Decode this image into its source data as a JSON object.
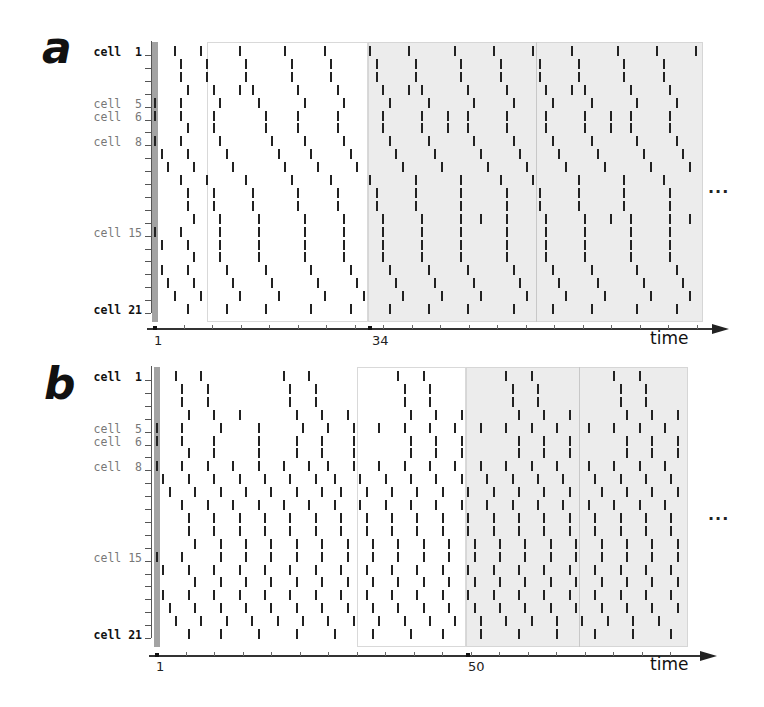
{
  "chart_data": [
    {
      "type": "raster",
      "panel": "a",
      "title": "",
      "xlabel": "time",
      "ylabel": "",
      "cells": 21,
      "ytick_labels": [
        {
          "cell": 1,
          "label": "cell  1",
          "style": "bold"
        },
        {
          "cell": 5,
          "label": "cell  5",
          "style": "light"
        },
        {
          "cell": 6,
          "label": "cell  6",
          "style": "light"
        },
        {
          "cell": 8,
          "label": "cell  8",
          "style": "light"
        },
        {
          "cell": 15,
          "label": "cell 15",
          "style": "light"
        },
        {
          "cell": 21,
          "label": "cell 21",
          "style": "bold"
        }
      ],
      "xtick_labels": [
        {
          "t": 1,
          "label": "1"
        },
        {
          "t": 34,
          "label": "34"
        }
      ],
      "initial_stimulus_cells": [
        5,
        6,
        8,
        15
      ],
      "transient_region": [
        9,
        34
      ],
      "periodic_region_start": 34,
      "period_divider_t": 59.5,
      "x_range": [
        1,
        85
      ],
      "continues": "...",
      "spikes": [
        [
          4,
          8,
          14,
          21,
          27,
          34,
          40,
          47,
          53,
          59,
          65,
          72,
          78,
          84
        ],
        [
          5,
          9,
          15,
          22,
          28,
          35,
          41,
          48,
          54,
          60,
          66,
          73,
          79
        ],
        [
          5,
          9,
          15,
          22,
          28,
          35,
          41,
          48,
          54,
          60,
          66,
          73,
          79
        ],
        [
          6,
          10,
          14,
          16,
          23,
          29,
          36,
          40,
          42,
          49,
          55,
          61,
          65,
          67,
          74,
          80
        ],
        [
          1,
          5,
          11,
          17,
          24,
          30,
          37,
          43,
          50,
          56,
          62,
          68,
          75,
          81
        ],
        [
          1,
          5,
          10,
          18,
          23,
          29,
          36,
          42,
          46,
          49,
          55,
          61,
          67,
          71,
          74,
          80
        ],
        [
          6,
          10,
          18,
          23,
          29,
          36,
          42,
          46,
          49,
          55,
          61,
          67,
          71,
          74,
          80
        ],
        [
          1,
          5,
          11,
          19,
          24,
          30,
          37,
          43,
          50,
          56,
          62,
          68,
          75,
          81
        ],
        [
          2,
          6,
          12,
          20,
          25,
          31,
          38,
          44,
          51,
          57,
          63,
          69,
          76,
          82
        ],
        [
          3,
          7,
          13,
          21,
          26,
          32,
          39,
          45,
          52,
          58,
          64,
          70,
          77,
          83
        ],
        [
          5,
          9,
          15,
          22,
          28,
          34,
          41,
          48,
          54,
          59,
          66,
          73,
          79
        ],
        [
          6,
          10,
          16,
          23,
          29,
          35,
          41,
          48,
          55,
          60,
          66,
          73,
          80
        ],
        [
          6,
          10,
          16,
          23,
          29,
          35,
          41,
          48,
          55,
          60,
          66,
          73,
          80
        ],
        [
          7,
          11,
          17,
          24,
          30,
          36,
          42,
          48,
          51,
          55,
          61,
          67,
          71,
          74,
          80,
          83
        ],
        [
          1,
          5,
          11,
          17,
          24,
          30,
          36,
          42,
          48,
          55,
          61,
          67,
          74,
          80
        ],
        [
          2,
          6,
          11,
          17,
          24,
          30,
          36,
          42,
          48,
          55,
          61,
          67,
          74,
          80
        ],
        [
          7,
          11,
          17,
          24,
          30,
          36,
          42,
          48,
          55,
          61,
          67,
          74,
          80
        ],
        [
          2,
          6,
          12,
          18,
          25,
          31,
          37,
          43,
          49,
          56,
          62,
          68,
          75,
          81
        ],
        [
          3,
          7,
          13,
          19,
          26,
          32,
          38,
          44,
          50,
          57,
          63,
          69,
          76,
          82
        ],
        [
          4,
          8,
          14,
          20,
          27,
          33,
          39,
          45,
          51,
          58,
          64,
          70,
          77,
          83
        ],
        [
          6,
          12,
          18,
          25,
          31,
          37,
          43,
          49,
          56,
          62,
          68,
          75,
          81
        ]
      ]
    },
    {
      "type": "raster",
      "panel": "b",
      "title": "",
      "xlabel": "time",
      "ylabel": "",
      "cells": 21,
      "ytick_labels": [
        {
          "cell": 1,
          "label": "cell  1",
          "style": "bold"
        },
        {
          "cell": 5,
          "label": "cell  5",
          "style": "light"
        },
        {
          "cell": 6,
          "label": "cell  6",
          "style": "light"
        },
        {
          "cell": 8,
          "label": "cell  8",
          "style": "light"
        },
        {
          "cell": 15,
          "label": "cell 15",
          "style": "light"
        },
        {
          "cell": 21,
          "label": "cell 21",
          "style": "bold"
        }
      ],
      "xtick_labels": [
        {
          "t": 1,
          "label": "1"
        },
        {
          "t": 50,
          "label": "50"
        }
      ],
      "initial_stimulus_cells": [
        5,
        6,
        8,
        15
      ],
      "transient_region": [
        33,
        50
      ],
      "periodic_region_start": 50,
      "period_divider_t": 67.5,
      "x_range": [
        1,
        84
      ],
      "continues": "...",
      "spikes": [
        [
          4,
          8,
          21,
          25,
          39,
          43,
          56,
          60,
          73,
          77
        ],
        [
          5,
          9,
          22,
          26,
          40,
          44,
          57,
          61,
          74,
          78
        ],
        [
          5,
          9,
          22,
          26,
          40,
          44,
          57,
          61,
          74,
          78
        ],
        [
          6,
          10,
          14,
          23,
          27,
          31,
          41,
          45,
          49,
          58,
          62,
          66,
          75,
          79,
          83
        ],
        [
          1,
          5,
          11,
          17,
          24,
          28,
          32,
          36,
          40,
          44,
          48,
          52,
          56,
          60,
          64,
          69,
          73,
          77,
          81
        ],
        [
          1,
          5,
          10,
          17,
          23,
          27,
          32,
          41,
          45,
          49,
          58,
          62,
          66,
          75,
          79,
          83
        ],
        [
          6,
          10,
          17,
          23,
          27,
          32,
          41,
          45,
          49,
          58,
          62,
          66,
          75,
          79,
          83
        ],
        [
          1,
          5,
          9,
          13,
          17,
          21,
          25,
          28,
          32,
          36,
          40,
          44,
          48,
          52,
          56,
          60,
          64,
          69,
          73,
          77,
          81
        ],
        [
          2,
          6,
          10,
          14,
          18,
          22,
          26,
          29,
          33,
          37,
          41,
          45,
          49,
          53,
          57,
          61,
          65,
          70,
          74,
          78,
          82
        ],
        [
          3,
          7,
          11,
          15,
          19,
          23,
          27,
          30,
          34,
          38,
          42,
          46,
          50,
          54,
          58,
          62,
          66,
          71,
          75,
          79,
          83
        ],
        [
          5,
          9,
          13,
          17,
          21,
          25,
          29,
          33,
          37,
          41,
          45,
          49,
          53,
          57,
          61,
          65,
          69,
          73,
          77,
          81
        ],
        [
          6,
          10,
          14,
          18,
          22,
          26,
          30,
          34,
          38,
          42,
          46,
          50,
          54,
          58,
          62,
          66,
          70,
          74,
          78,
          82
        ],
        [
          6,
          10,
          14,
          18,
          22,
          26,
          30,
          34,
          38,
          42,
          46,
          50,
          54,
          58,
          62,
          66,
          70,
          74,
          78,
          82
        ],
        [
          7,
          11,
          15,
          19,
          23,
          27,
          31,
          35,
          39,
          43,
          47,
          51,
          55,
          59,
          63,
          67,
          71,
          75,
          79,
          83
        ],
        [
          1,
          5,
          11,
          15,
          19,
          23,
          27,
          31,
          35,
          39,
          43,
          47,
          51,
          55,
          59,
          63,
          67,
          71,
          75,
          79,
          83
        ],
        [
          2,
          6,
          10,
          14,
          18,
          22,
          26,
          30,
          34,
          38,
          42,
          46,
          50,
          54,
          58,
          62,
          66,
          70,
          74,
          78,
          82
        ],
        [
          7,
          11,
          15,
          19,
          23,
          27,
          31,
          35,
          39,
          43,
          47,
          51,
          55,
          59,
          63,
          67,
          71,
          75,
          79,
          83
        ],
        [
          2,
          6,
          10,
          14,
          18,
          22,
          26,
          30,
          34,
          38,
          42,
          46,
          50,
          54,
          58,
          62,
          66,
          70,
          74,
          78,
          82
        ],
        [
          3,
          7,
          11,
          15,
          19,
          23,
          27,
          31,
          35,
          39,
          43,
          47,
          51,
          55,
          59,
          63,
          67,
          71,
          75,
          79,
          83
        ],
        [
          4,
          8,
          12,
          16,
          20,
          24,
          28,
          32,
          36,
          40,
          44,
          48,
          52,
          56,
          60,
          64,
          68,
          72,
          76,
          80
        ],
        [
          6,
          11,
          17,
          23,
          29,
          35,
          41,
          46,
          52,
          58,
          64,
          70,
          76,
          82
        ]
      ]
    }
  ],
  "panels": [
    {
      "letter": "a",
      "time_label": "time",
      "tick_start": "1",
      "tick_mark": "34",
      "ellipsis": "..."
    },
    {
      "letter": "b",
      "time_label": "time",
      "tick_start": "1",
      "tick_mark": "50",
      "ellipsis": "..."
    }
  ],
  "colors": {
    "spike": "#222222",
    "initial_bar": "#a3a3a3",
    "shaded_region": "#ececec",
    "label_dark": "#111111",
    "label_light": "#777777"
  }
}
